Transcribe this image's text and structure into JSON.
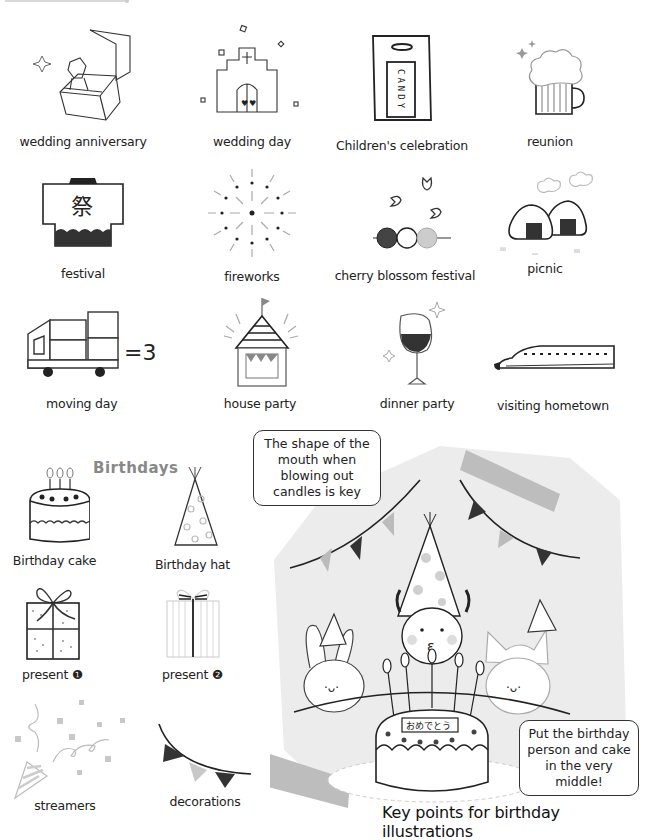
{
  "events": [
    {
      "label": "wedding anniversary",
      "icon": "ring-box-icon"
    },
    {
      "label": "wedding day",
      "icon": "chapel-icon"
    },
    {
      "label": "Children's celebration",
      "icon": "candy-bag-icon",
      "icon_text": "CANDY"
    },
    {
      "label": "reunion",
      "icon": "beer-mug-icon"
    },
    {
      "label": "festival",
      "icon": "happi-coat-icon",
      "icon_text": "祭"
    },
    {
      "label": "fireworks",
      "icon": "fireworks-icon"
    },
    {
      "label": "cherry blossom festival",
      "icon": "dango-petals-icon"
    },
    {
      "label": "picnic",
      "icon": "onigiri-icon"
    },
    {
      "label": "moving day",
      "icon": "moving-truck-icon",
      "icon_text": "=3"
    },
    {
      "label": "house party",
      "icon": "party-house-icon"
    },
    {
      "label": "dinner party",
      "icon": "wine-glass-icon"
    },
    {
      "label": "visiting hometown",
      "icon": "bullet-train-icon"
    }
  ],
  "birthdays": {
    "title": "Birthdays",
    "items": [
      {
        "label": "Birthday cake",
        "icon": "birthday-cake-icon"
      },
      {
        "label": "Birthday hat",
        "icon": "party-hat-icon"
      },
      {
        "label": "present ❶",
        "icon": "present-bow-icon"
      },
      {
        "label": "present ❷",
        "icon": "striped-present-icon"
      },
      {
        "label": "streamers",
        "icon": "party-popper-icon"
      },
      {
        "label": "decorations",
        "icon": "bunting-icon"
      }
    ]
  },
  "scene": {
    "bubble_top": "The shape of the mouth when blowing out candles is key",
    "bubble_bottom": "Put the birthday person and cake in the very middle!",
    "cake_plate_text": "おめでとう",
    "caption": "Key points for birthday illustrations",
    "colors": {
      "panel": "#ececec",
      "tape": "#bdbdbd",
      "bunting_dark": "#3a3a3a",
      "bunting_light": "#c8c8c8"
    }
  }
}
